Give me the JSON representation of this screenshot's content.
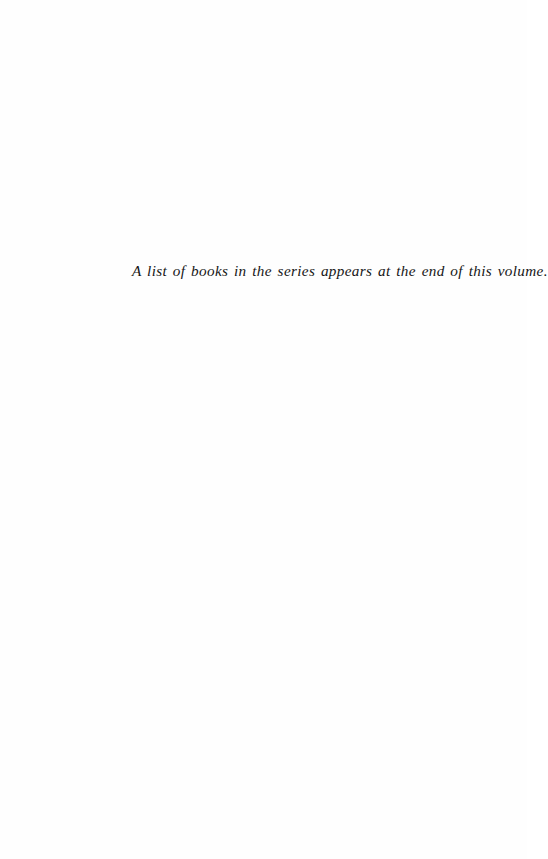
{
  "page": {
    "type": "book-front-matter",
    "note": "A list of books in the series appears at the end of this volume."
  }
}
